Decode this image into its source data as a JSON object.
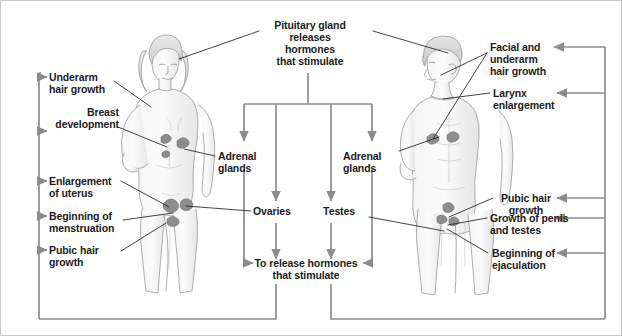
{
  "diagram": {
    "title_center_top": "Pituitary gland\nreleases\nhormones\nthat stimulate",
    "title_center_bottom": "To release hormones\nthat stimulate",
    "colors": {
      "connector": "#8c8c8c",
      "leader": "#2b2b2b",
      "text": "#1c1c1c",
      "background": "#ffffff",
      "figure_ink": "#9a9a9a",
      "figure_fill": "#f2f2f2",
      "organ": "#8a8a8a"
    }
  },
  "center": {
    "top_box": "Pituitary gland\nreleases\nhormones\nthat stimulate",
    "bottom_box": "To release hormones\nthat stimulate",
    "glands": [
      {
        "name": "adrenal-glands-left",
        "label": "Adrenal\nglands"
      },
      {
        "name": "ovaries",
        "label": "Ovaries"
      },
      {
        "name": "testes",
        "label": "Testes"
      },
      {
        "name": "adrenal-glands-right",
        "label": "Adrenal\nglands"
      }
    ]
  },
  "female": {
    "figure_name": "female-body-illustration",
    "effects": [
      {
        "label": "Underarm\nhair growth"
      },
      {
        "label": "Breast\ndevelopment"
      },
      {
        "label": "Enlargement\nof uterus"
      },
      {
        "label": "Beginning of\nmenstruation"
      },
      {
        "label": "Pubic hair\ngrowth"
      }
    ]
  },
  "male": {
    "figure_name": "male-body-illustration",
    "effects": [
      {
        "label": "Facial and\nunderarm\nhair growth"
      },
      {
        "label": "Larynx\nenlargement"
      },
      {
        "label": "Pubic hair\ngrowth"
      },
      {
        "label": "Growth of penis\nand testes"
      },
      {
        "label": "Beginning of\nejaculation"
      }
    ]
  }
}
